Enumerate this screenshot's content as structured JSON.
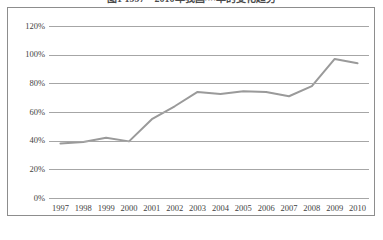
{
  "title": "图1 1997—2010年我国××率的变化趋势",
  "chart_data": {
    "type": "line",
    "title": "图1 1997—2010年我国××率的变化趋势",
    "xlabel": "",
    "ylabel": "",
    "x": [
      "1997",
      "1998",
      "1999",
      "2000",
      "2001",
      "2002",
      "2003",
      "2004",
      "2005",
      "2006",
      "2007",
      "2008",
      "2009",
      "2010"
    ],
    "categories": [
      "1997",
      "1998",
      "1999",
      "2000",
      "2001",
      "2002",
      "2003",
      "2004",
      "2005",
      "2006",
      "2007",
      "2008",
      "2009",
      "2010"
    ],
    "values": [
      38,
      39,
      42,
      39.5,
      55,
      64,
      74,
      72.5,
      74.5,
      74,
      71,
      78,
      97,
      94
    ],
    "series": [
      {
        "name": "比率",
        "values": [
          38,
          39,
          42,
          39.5,
          55,
          64,
          74,
          72.5,
          74.5,
          74,
          71,
          78,
          97,
          94
        ]
      }
    ],
    "ylim": [
      0,
      120
    ],
    "yticks": [
      0,
      20,
      40,
      60,
      80,
      100,
      120
    ],
    "ytick_labels": [
      "0%",
      "20%",
      "40%",
      "60%",
      "80%",
      "100%",
      "120%"
    ],
    "grid": true,
    "legend": false,
    "legend_position": "none",
    "line_color": "#9a9a9a",
    "grid_color": "#a6a6a6",
    "frame_color": "#8d8d8d",
    "value_format": "percent"
  }
}
